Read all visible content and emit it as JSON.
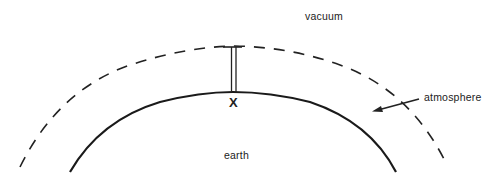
{
  "diagram": {
    "labels": {
      "vacuum": "vacuum",
      "atmosphere": "atmosphere",
      "earth": "earth",
      "point": "X"
    },
    "elements": [
      {
        "name": "earth-surface",
        "style": "solid-arc"
      },
      {
        "name": "atmosphere-boundary",
        "style": "dashed-arc"
      },
      {
        "name": "barometer-column",
        "style": "double-line-with-cap"
      },
      {
        "name": "atmosphere-arrow",
        "style": "arrow"
      }
    ],
    "colors": {
      "ink": "#222222",
      "background": "#ffffff"
    }
  }
}
